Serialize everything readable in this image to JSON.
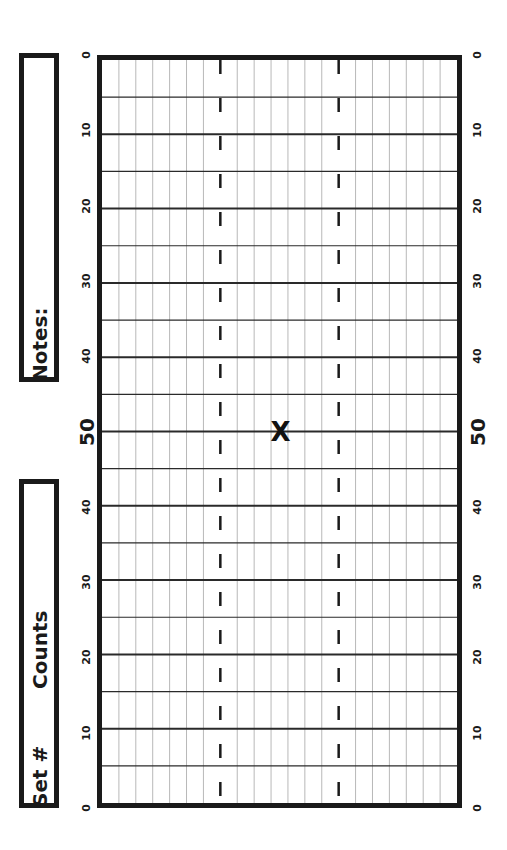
{
  "sidebar": {
    "notes_label": "Notes:",
    "set_label": "Set #",
    "counts_label": "Counts"
  },
  "field": {
    "yard_labels_left": [
      "0",
      "10",
      "20",
      "30",
      "40",
      "50",
      "40",
      "30",
      "20",
      "10",
      "0"
    ],
    "yard_labels_right": [
      "0",
      "10",
      "20",
      "30",
      "40",
      "50",
      "40",
      "30",
      "20",
      "10",
      "0"
    ],
    "columns": 21,
    "hash_columns": [
      7,
      14
    ],
    "yard_line_interval": 5,
    "marker": {
      "symbol": "X",
      "yard": 50,
      "column": 10
    }
  },
  "colors": {
    "ink": "#1a1a1a",
    "grid_light": "#b8b8b8",
    "grid_dark": "#2a2a2a"
  }
}
